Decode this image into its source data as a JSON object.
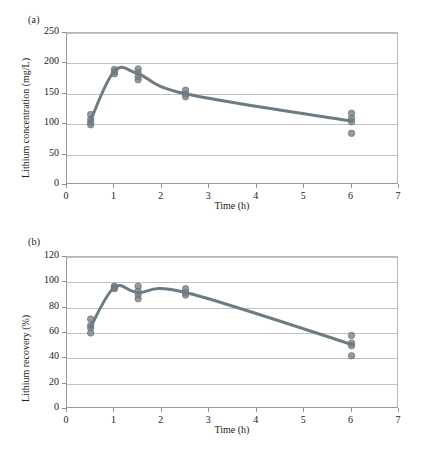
{
  "figure": {
    "panels": [
      {
        "label": "(a)",
        "chart_data": {
          "type": "scatter",
          "title": "",
          "xlabel": "Time (h)",
          "ylabel": "Lithium concentration (mg/L)",
          "xlim": [
            0,
            7
          ],
          "ylim": [
            0,
            250
          ],
          "xticks": [
            0,
            1,
            2,
            3,
            4,
            5,
            6,
            7
          ],
          "yticks": [
            0,
            50,
            100,
            150,
            200,
            250
          ],
          "grid": true,
          "legend": "none",
          "series": [
            {
              "name": "Lithium concentration",
              "x": [
                0.5,
                1,
                1.5,
                2.5,
                6
              ],
              "values": [
                107,
                187,
                183,
                150,
                105
              ]
            }
          ],
          "points": [
            {
              "x": 0.5,
              "y": 116
            },
            {
              "x": 0.5,
              "y": 108
            },
            {
              "x": 0.5,
              "y": 103
            },
            {
              "x": 0.5,
              "y": 99
            },
            {
              "x": 1.0,
              "y": 190
            },
            {
              "x": 1.0,
              "y": 186
            },
            {
              "x": 1.0,
              "y": 183
            },
            {
              "x": 1.5,
              "y": 191
            },
            {
              "x": 1.5,
              "y": 185
            },
            {
              "x": 1.5,
              "y": 178
            },
            {
              "x": 1.5,
              "y": 173
            },
            {
              "x": 2.5,
              "y": 156
            },
            {
              "x": 2.5,
              "y": 150
            },
            {
              "x": 2.5,
              "y": 145
            },
            {
              "x": 6.0,
              "y": 118
            },
            {
              "x": 6.0,
              "y": 110
            },
            {
              "x": 6.0,
              "y": 104
            },
            {
              "x": 6.0,
              "y": 85
            }
          ]
        }
      },
      {
        "label": "(b)",
        "chart_data": {
          "type": "scatter",
          "title": "",
          "xlabel": "Time (h)",
          "ylabel": "Lithium recovery (%)",
          "xlim": [
            0,
            7
          ],
          "ylim": [
            0,
            120
          ],
          "xticks": [
            0,
            1,
            2,
            3,
            4,
            5,
            6,
            7
          ],
          "yticks": [
            0,
            20,
            40,
            60,
            80,
            100,
            120
          ],
          "grid": true,
          "legend": "none",
          "series": [
            {
              "name": "Lithium recovery",
              "x": [
                0.5,
                1,
                1.5,
                2.5,
                6
              ],
              "values": [
                65,
                96,
                92,
                92,
                51
              ]
            }
          ],
          "points": [
            {
              "x": 0.5,
              "y": 71
            },
            {
              "x": 0.5,
              "y": 66
            },
            {
              "x": 0.5,
              "y": 64
            },
            {
              "x": 0.5,
              "y": 60
            },
            {
              "x": 1.0,
              "y": 97
            },
            {
              "x": 1.0,
              "y": 96
            },
            {
              "x": 1.0,
              "y": 95
            },
            {
              "x": 1.5,
              "y": 97
            },
            {
              "x": 1.5,
              "y": 93
            },
            {
              "x": 1.5,
              "y": 90
            },
            {
              "x": 1.5,
              "y": 87
            },
            {
              "x": 2.5,
              "y": 95
            },
            {
              "x": 2.5,
              "y": 92
            },
            {
              "x": 2.5,
              "y": 90
            },
            {
              "x": 6.0,
              "y": 58
            },
            {
              "x": 6.0,
              "y": 52
            },
            {
              "x": 6.0,
              "y": 50
            },
            {
              "x": 6.0,
              "y": 42
            }
          ]
        }
      }
    ],
    "colors": {
      "series": "#6e7b82",
      "marker": "#6e7b82",
      "grid": "#c2c2c2",
      "axis": "#9a9a9a",
      "text": "#1a1a1a"
    }
  }
}
